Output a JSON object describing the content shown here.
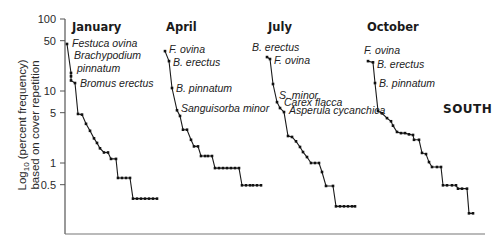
{
  "chart_data": {
    "type": "line",
    "title": "",
    "region_label": "SOUTH",
    "ylabel_line1": "Log10 (percent frequency)",
    "ylabel_line2": "based on cover repetition",
    "yscale": "log",
    "ylim": [
      0.1,
      100
    ],
    "yticks": [
      100,
      50,
      10,
      5,
      1,
      0.5
    ],
    "ytick_labels": [
      "100",
      "50",
      "10",
      "5",
      "1",
      "0.5"
    ],
    "xlabel": "",
    "grid": false,
    "series": [
      {
        "name": "January",
        "x": [
          67,
          71,
          71,
          71,
          75,
          78,
          82,
          86,
          90,
          94,
          97,
          100,
          104,
          108,
          111,
          116,
          118,
          122,
          126,
          130,
          133,
          137,
          141,
          145,
          149,
          153,
          157
        ],
        "values": [
          45,
          17.8,
          16,
          14,
          12.9,
          4.8,
          4.7,
          3.5,
          2.8,
          2.2,
          1.9,
          1.6,
          1.4,
          1.4,
          1.14,
          1.14,
          0.62,
          0.62,
          0.62,
          0.62,
          0.32,
          0.32,
          0.32,
          0.32,
          0.32,
          0.32,
          0.32
        ],
        "annotations": [
          {
            "label": "Festuca ovina",
            "point": 0
          },
          {
            "label": "Brachypodium pinnatum",
            "point": 1
          },
          {
            "label": "Bromus erectus",
            "point": 4
          }
        ]
      },
      {
        "name": "April",
        "x": [
          165,
          169,
          172,
          177,
          180,
          183,
          187,
          191,
          194,
          198,
          201,
          205,
          208,
          212,
          215,
          219,
          223,
          227,
          231,
          235,
          239,
          242,
          246,
          250,
          253,
          257,
          261
        ],
        "values": [
          35.8,
          26,
          11,
          5.4,
          4.5,
          2.9,
          2.9,
          2.1,
          1.7,
          1.7,
          1.25,
          1.25,
          1.25,
          1.25,
          0.85,
          0.85,
          0.85,
          0.85,
          0.85,
          0.85,
          0.85,
          0.49,
          0.49,
          0.49,
          0.49,
          0.49,
          0.49
        ],
        "annotations": [
          {
            "label": "F. ovina",
            "point": 0
          },
          {
            "label": "B. erectus",
            "point": 1
          },
          {
            "label": "B. pinnatum",
            "point": 2
          },
          {
            "label": "Sanguisorba minor",
            "point": 3
          }
        ]
      },
      {
        "name": "July",
        "x": [
          267,
          270,
          273,
          277,
          280,
          284,
          288,
          292,
          296,
          300,
          303,
          307,
          311,
          315,
          319,
          322,
          326,
          333,
          336,
          340,
          344,
          348,
          352,
          355
        ],
        "values": [
          29.6,
          27.8,
          12.5,
          7,
          5.8,
          5.1,
          2.37,
          2.3,
          2.0,
          1.67,
          1.42,
          1.21,
          1.0,
          1.0,
          1.0,
          0.75,
          0.48,
          0.48,
          0.25,
          0.25,
          0.25,
          0.25,
          0.25,
          0.25
        ],
        "annotations": [
          {
            "label": "B. erectus",
            "point": 0
          },
          {
            "label": "F. ovina",
            "point": 1
          },
          {
            "label": "S. minor",
            "point": 3
          },
          {
            "label": "Carex flacca",
            "point": 4
          },
          {
            "label": "Asperula cycanchica",
            "point": 5
          }
        ]
      },
      {
        "name": "October",
        "x": [
          368,
          373,
          375,
          378,
          382,
          387,
          391,
          393,
          397,
          401,
          405,
          409,
          413,
          414,
          419,
          422,
          426,
          429,
          432,
          437,
          441,
          443,
          447,
          452,
          456,
          458,
          462,
          467,
          469,
          473
        ],
        "values": [
          26,
          25,
          12.9,
          5.3,
          4.9,
          4.2,
          3.8,
          3.3,
          2.7,
          2.6,
          2.6,
          2.5,
          2.45,
          2.1,
          2.1,
          1.38,
          1.33,
          1.03,
          0.88,
          0.88,
          0.88,
          0.49,
          0.49,
          0.49,
          0.49,
          0.44,
          0.44,
          0.44,
          0.2,
          0.2
        ],
        "annotations": [
          {
            "label": "F. ovina",
            "point": 0
          },
          {
            "label": "B. erectus",
            "point": 1
          },
          {
            "label": "B. pinnatum",
            "point": 2
          }
        ]
      }
    ]
  },
  "labels": {
    "ylabel_line1_prefix": "Log",
    "ylabel_line1_sub": "10",
    "ylabel_line1_rest": " (percent frequency)",
    "ylabel_line2": "based on cover repetition",
    "region": "SOUTH",
    "panels": [
      "January",
      "April",
      "July",
      "October"
    ]
  }
}
